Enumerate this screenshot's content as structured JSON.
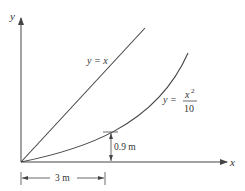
{
  "diagram": {
    "axes": {
      "x_label": "x",
      "y_label": "y"
    },
    "curves": [
      {
        "name": "line",
        "equation_lhs": "y = ",
        "equation_rhs": "x"
      },
      {
        "name": "parabola",
        "equation_lhs": "y = ",
        "numerator_base": "x",
        "numerator_exp": "2",
        "denominator": "10"
      }
    ],
    "dimensions": {
      "horizontal": "3 m",
      "vertical": "0.9 m"
    },
    "colors": {
      "stroke": "#444444",
      "text": "#333333",
      "background": "#ffffff"
    }
  }
}
